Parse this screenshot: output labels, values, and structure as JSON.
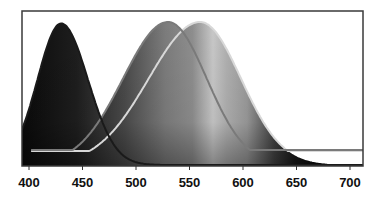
{
  "chart_data": {
    "type": "area",
    "title": "",
    "xlabel": "",
    "ylabel": "",
    "xlim": [
      393,
      718
    ],
    "ylim": [
      0,
      1
    ],
    "grid": false,
    "legend": null,
    "x_ticks": [
      400,
      450,
      500,
      550,
      600,
      650,
      700
    ],
    "x_tick_labels": [
      "400",
      "450",
      "500",
      "550",
      "600",
      "650",
      "700"
    ],
    "series": [
      {
        "name": "S-cone (blue)",
        "peak_nm": 430,
        "peak_value": 0.93,
        "sigma_left": 22,
        "sigma_right": 25,
        "line_color": "#1a1a1a"
      },
      {
        "name": "M-cone (green)",
        "peak_nm": 530,
        "peak_value": 0.94,
        "sigma_left": 42,
        "sigma_right": 36,
        "line_color": "#7a7a7a"
      },
      {
        "name": "L-cone (red)",
        "peak_nm": 560,
        "peak_value": 0.94,
        "sigma_left": 48,
        "sigma_right": 38,
        "line_color": "#d8d8d8"
      }
    ],
    "fill": "grayscale spectrum gradient under envelope of curves"
  },
  "axis": {
    "ticks": [
      "400",
      "450",
      "500",
      "550",
      "600",
      "650",
      "700"
    ]
  }
}
